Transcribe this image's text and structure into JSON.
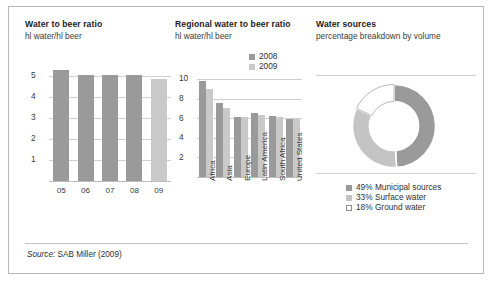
{
  "figure": {
    "source_prefix": "Source:",
    "source_text": "SAB Miller (2009)"
  },
  "colors": {
    "series_2008": "#9a9a9a",
    "series_2009": "#c9c9c9",
    "donut_municipal": "#9a9a9a",
    "donut_surface": "#c4c4c4",
    "donut_ground": "#ffffff",
    "gridline": "#cfcfcf",
    "frame": "#b9b9b9"
  },
  "panels": [
    {
      "id": "water-to-beer-ratio",
      "title": "Water to beer ratio",
      "subtitle": "hl water/hl beer"
    },
    {
      "id": "regional-water-to-beer-ratio",
      "title": "Regional water to beer ratio",
      "subtitle": "hl water/hl beer"
    },
    {
      "id": "water-sources",
      "title": "Water sources",
      "subtitle": "percentage breakdown by volume"
    }
  ],
  "chart_data": [
    {
      "type": "bar",
      "id": "water-to-beer-ratio",
      "title": "Water to beer ratio",
      "xlabel": "",
      "ylabel": "hl water/hl beer",
      "categories": [
        "05",
        "06",
        "07",
        "08",
        "09"
      ],
      "values": [
        5.25,
        5.05,
        5.05,
        5.03,
        4.85
      ],
      "bar_colors": [
        "#9a9a9a",
        "#9a9a9a",
        "#9a9a9a",
        "#9a9a9a",
        "#c9c9c9"
      ],
      "yticks": [
        1,
        2,
        3,
        4,
        5
      ],
      "ylim": [
        0,
        5.6
      ],
      "grid": true,
      "legend": "none"
    },
    {
      "type": "bar",
      "id": "regional-water-to-beer-ratio",
      "title": "Regional water to beer ratio",
      "xlabel": "",
      "ylabel": "hl water/hl beer",
      "categories": [
        "Africa",
        "Asia",
        "Europe",
        "Latin America",
        "South Africa",
        "United States"
      ],
      "series": [
        {
          "name": "2008",
          "values": [
            9.8,
            7.5,
            6.1,
            6.5,
            6.2,
            5.9
          ],
          "color": "#9a9a9a"
        },
        {
          "name": "2009",
          "values": [
            9.0,
            7.0,
            6.1,
            6.3,
            6.1,
            5.9
          ],
          "color": "#c9c9c9"
        }
      ],
      "yticks": [
        2,
        4,
        6,
        8,
        10
      ],
      "ylim": [
        0,
        11
      ],
      "grid": true,
      "legend": "top-right"
    },
    {
      "type": "pie",
      "id": "water-sources",
      "title": "Water sources",
      "subtitle": "percentage breakdown by volume",
      "donut": true,
      "labels": [
        "Municipal sources",
        "Surface water",
        "Ground water"
      ],
      "values": [
        49,
        33,
        18
      ],
      "slice_colors": [
        "#9a9a9a",
        "#c4c4c4",
        "#ffffff"
      ],
      "legend_entries": [
        {
          "text": "49% Municipal sources",
          "color": "#9a9a9a",
          "outlined": false
        },
        {
          "text": "33% Surface water",
          "color": "#c4c4c4",
          "outlined": false
        },
        {
          "text": "18% Ground water",
          "color": "#ffffff",
          "outlined": true
        }
      ],
      "legend": "bottom-left"
    }
  ]
}
